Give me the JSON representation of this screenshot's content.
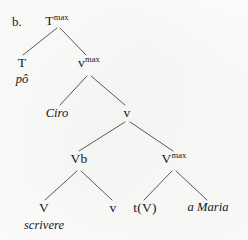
{
  "figure": {
    "panel_label": "b.",
    "kind": "syntactic-tree-diagram",
    "ink_color": "#14181c",
    "edge_color": "#54585f",
    "background_color": "#fbfbf9"
  },
  "nodes": {
    "root": {
      "base": "T",
      "sup": "max"
    },
    "t_head": {
      "base": "T",
      "sup": ""
    },
    "v_max_upper": {
      "base": "v",
      "sup": "max"
    },
    "little_v": {
      "base": "v",
      "sup": ""
    },
    "vb": {
      "base": "Vb",
      "sup": ""
    },
    "v_max_lower": {
      "base": "V",
      "sup": "max"
    },
    "big_v": {
      "base": "V",
      "sup": ""
    },
    "little_v_trace_sister": {
      "base": "v",
      "sup": ""
    },
    "trace": {
      "base": "t(V)",
      "sup": ""
    }
  },
  "terminals": {
    "po": "pô",
    "ciro": "Ciro",
    "scrivere": "scrivere",
    "a_maria": "a Maria"
  },
  "edges": [
    {
      "name": "root-to-t",
      "x1": 57,
      "y1": 28,
      "x2": 23,
      "y2": 55
    },
    {
      "name": "root-to-vmax",
      "x1": 60,
      "y1": 28,
      "x2": 86,
      "y2": 55
    },
    {
      "name": "vmax-to-ciro",
      "x1": 87,
      "y1": 76,
      "x2": 60,
      "y2": 105
    },
    {
      "name": "vmax-to-v",
      "x1": 91,
      "y1": 76,
      "x2": 125,
      "y2": 105
    },
    {
      "name": "v-to-vb",
      "x1": 125,
      "y1": 122,
      "x2": 79,
      "y2": 151
    },
    {
      "name": "v-to-vmaxlower",
      "x1": 130,
      "y1": 122,
      "x2": 173,
      "y2": 151
    },
    {
      "name": "vb-to-bigv",
      "x1": 77,
      "y1": 171,
      "x2": 45,
      "y2": 200
    },
    {
      "name": "vb-to-littlev",
      "x1": 81,
      "y1": 171,
      "x2": 112,
      "y2": 200
    },
    {
      "name": "vmaxlower-to-t",
      "x1": 172,
      "y1": 171,
      "x2": 144,
      "y2": 200
    },
    {
      "name": "vmaxlower-to-am",
      "x1": 176,
      "y1": 171,
      "x2": 207,
      "y2": 200
    }
  ],
  "positions": {
    "panel_label": {
      "x": 12,
      "y": 15
    },
    "root": {
      "x": 57,
      "y": 14
    },
    "t_head": {
      "x": 22,
      "y": 56
    },
    "po": {
      "x": 22,
      "y": 73
    },
    "v_max_upper": {
      "x": 89,
      "y": 56
    },
    "ciro": {
      "x": 57,
      "y": 107
    },
    "little_v": {
      "x": 127,
      "y": 106
    },
    "vb": {
      "x": 79,
      "y": 152
    },
    "v_max_lower": {
      "x": 174,
      "y": 152
    },
    "big_v": {
      "x": 44,
      "y": 201
    },
    "scrivere": {
      "x": 44,
      "y": 219
    },
    "little_v2": {
      "x": 113,
      "y": 201
    },
    "trace": {
      "x": 145,
      "y": 201
    },
    "a_maria": {
      "x": 208,
      "y": 201
    }
  }
}
